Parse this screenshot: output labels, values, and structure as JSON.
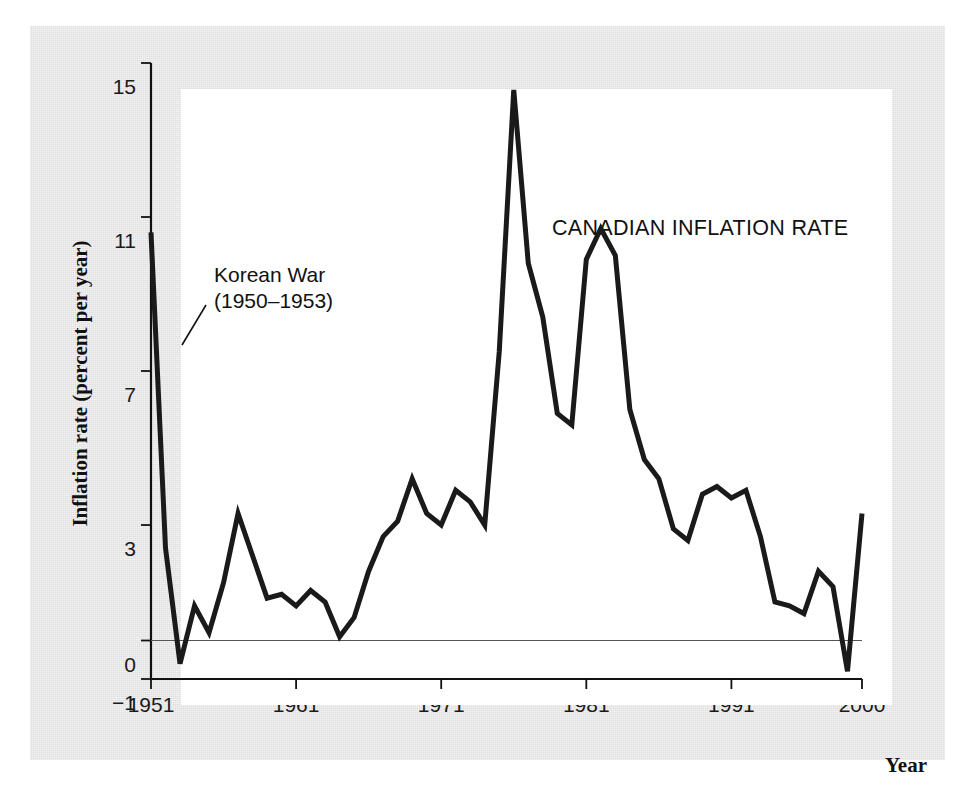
{
  "figure": {
    "panel_bg": "#e3e3e3",
    "plot_bg": "#ffffff",
    "line_color": "#1a1a1a"
  },
  "axes": {
    "ylabel": "Inflation rate (percent per year)",
    "xlabel": "Year",
    "yticks": [
      "15",
      "11",
      "7",
      "3",
      "0",
      "−1"
    ],
    "ytick_values": [
      15,
      11,
      7,
      3,
      0,
      -1
    ],
    "xticks": [
      "1951",
      "1961",
      "1971",
      "1981",
      "1991",
      "2000"
    ],
    "xtick_values": [
      1951,
      1961,
      1971,
      1981,
      1991,
      2000
    ]
  },
  "series_title": "CANADIAN INFLATION RATE",
  "annotation": {
    "line1": "Korean War",
    "line2": "(1950–1953)"
  },
  "chart_data": {
    "type": "line",
    "title": "CANADIAN INFLATION RATE",
    "xlabel": "Year",
    "ylabel": "Inflation rate (percent per year)",
    "xlim": [
      1951,
      2000
    ],
    "ylim": [
      -1,
      15
    ],
    "grid": false,
    "legend": "none",
    "zero_line": true,
    "annotations": [
      {
        "text": "Korean War (1950–1953)",
        "x": 1952,
        "y": 9.0
      }
    ],
    "x": [
      1951,
      1952,
      1953,
      1954,
      1955,
      1956,
      1957,
      1958,
      1959,
      1960,
      1961,
      1962,
      1963,
      1964,
      1965,
      1966,
      1967,
      1968,
      1969,
      1970,
      1971,
      1972,
      1973,
      1974,
      1975,
      1976,
      1977,
      1978,
      1979,
      1980,
      1981,
      1982,
      1983,
      1984,
      1985,
      1986,
      1987,
      1988,
      1989,
      1990,
      1991,
      1992,
      1993,
      1994,
      1995,
      1996,
      1997,
      1998,
      1999,
      2000
    ],
    "y": [
      10.6,
      2.4,
      -0.6,
      0.9,
      0.2,
      1.5,
      3.3,
      2.2,
      1.1,
      1.2,
      0.9,
      1.3,
      1.0,
      0.1,
      0.6,
      1.8,
      2.7,
      3.1,
      4.2,
      3.3,
      3.0,
      3.9,
      3.6,
      3.0,
      7.5,
      14.3,
      9.8,
      8.4,
      5.9,
      5.6,
      9.9,
      10.7,
      10.0,
      6.0,
      4.7,
      4.2,
      2.9,
      2.6,
      3.8,
      4.0,
      3.7,
      3.9,
      2.7,
      1.0,
      0.9,
      0.7,
      1.8,
      1.4,
      -0.8,
      3.3
    ]
  }
}
